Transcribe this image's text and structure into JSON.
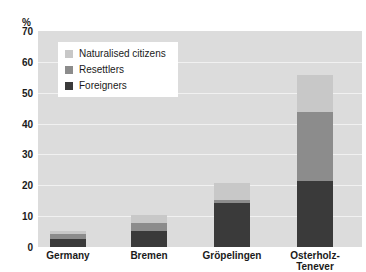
{
  "chart_data": {
    "type": "bar",
    "stacked": true,
    "title": "",
    "subtitle": "",
    "xlabel": "",
    "ylabel": "%",
    "unit_label": "%",
    "ylim": [
      0,
      70
    ],
    "yticks": [
      0,
      10,
      20,
      30,
      40,
      50,
      60,
      70
    ],
    "ytick_labels": [
      "0",
      "10",
      "20",
      "30",
      "40",
      "50",
      "60",
      "70"
    ],
    "grid": true,
    "grid_axis": "y",
    "legend_position": "top-left-inside",
    "categories": [
      "Germany",
      "Bremen",
      "Gröpelingen",
      "Osterholz-Tenever"
    ],
    "category_labels": [
      [
        "Germany"
      ],
      [
        "Bremen"
      ],
      [
        "Gröpelingen"
      ],
      [
        "Osterholz-",
        "Tenever"
      ]
    ],
    "series": [
      {
        "name": "Foreigners",
        "color": "#3a3a3a",
        "values": [
          9.5,
          13.5,
          26.0,
          24.0
        ]
      },
      {
        "name": "Resettlers",
        "color": "#8c8c8c",
        "values": [
          5.5,
          6.5,
          2.0,
          25.0
        ]
      },
      {
        "name": "Naturalised citizens",
        "color": "#c8c8c8",
        "values": [
          4.0,
          7.0,
          10.0,
          13.5
        ]
      }
    ],
    "totals": [
      19.0,
      27.0,
      38.0,
      62.5
    ],
    "plot_background": "#dcdcdc",
    "gridline_color": "#f1f1f1",
    "text_color": "#1a1a1a"
  },
  "legend": {
    "items": [
      {
        "label": "Naturalised citizens",
        "color": "#c8c8c8"
      },
      {
        "label": "Resettlers",
        "color": "#8c8c8c"
      },
      {
        "label": "Foreigners",
        "color": "#3a3a3a"
      }
    ]
  }
}
